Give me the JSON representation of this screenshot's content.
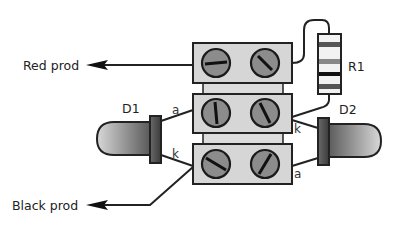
{
  "diagram": {
    "labels": {
      "red_prod": "Red prod",
      "black_prod": "Black prod",
      "d1": "D1",
      "d2": "D2",
      "r1": "R1",
      "d1_anode": "a",
      "d1_cathode": "k",
      "d2_anode": "a",
      "d2_cathode": "k"
    },
    "components": [
      {
        "id": "terminal-block",
        "type": "3-way screw terminal strip",
        "rows": 3
      },
      {
        "id": "R1",
        "type": "resistor"
      },
      {
        "id": "D1",
        "type": "LED",
        "side": "left"
      },
      {
        "id": "D2",
        "type": "LED",
        "side": "right"
      }
    ],
    "colors": {
      "block_fill": "#d6d6d6",
      "screw_fill": "#8c8c8c",
      "outline": "#222222",
      "led_light": "#d0d0d0",
      "led_dark": "#555555"
    }
  }
}
